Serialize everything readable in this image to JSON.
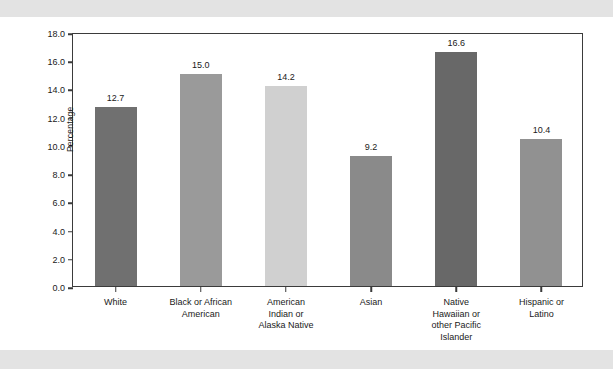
{
  "chart_data": {
    "type": "bar",
    "title": "",
    "subtitle": "",
    "xlabel": "",
    "ylabel": "Percentage",
    "ylim": [
      0,
      18
    ],
    "ytick_step": 2,
    "grid": false,
    "legend": "none",
    "categories": [
      "White",
      "Black or African American",
      "American Indian or Alaska Native",
      "Asian",
      "Native Hawaiian or other Pacific Islander",
      "Hispanic or Latino"
    ],
    "category_lines": [
      [
        "White"
      ],
      [
        "Black or African",
        "American"
      ],
      [
        "American",
        "Indian or",
        "Alaska Native"
      ],
      [
        "Asian"
      ],
      [
        "Native",
        "Hawaiian or",
        "other Pacific",
        "Islander"
      ],
      [
        "Hispanic or",
        "Latino"
      ]
    ],
    "values": [
      12.7,
      15.0,
      14.2,
      9.2,
      16.6,
      10.4
    ],
    "value_labels": [
      "12.7",
      "15.0",
      "14.2",
      "9.2",
      "16.6",
      "10.4"
    ],
    "bar_colors": [
      "#707070",
      "#9a9a9a",
      "#d0d0d0",
      "#8a8a8a",
      "#686868",
      "#919191"
    ],
    "ytick_labels": [
      "0.0",
      "2.0",
      "4.0",
      "6.0",
      "8.0",
      "10.0",
      "12.0",
      "14.0",
      "16.0",
      "18.0"
    ],
    "ytick_values": [
      0,
      2,
      4,
      6,
      8,
      10,
      12,
      14,
      16,
      18
    ],
    "axis_color": "#3b3b3b",
    "plot_background": "#ffffff",
    "page_background": "#ffffff",
    "band_color": "#e3e3e3"
  }
}
